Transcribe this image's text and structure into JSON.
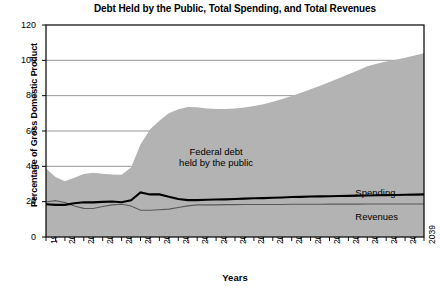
{
  "chart_data": {
    "type": "area",
    "title": "Debt Held by the Public, Total Spending, and Total Revenues",
    "xlabel": "Years",
    "ylabel": "Percentage of Gross Domestic Product",
    "xlim": [
      1999,
      2039
    ],
    "ylim": [
      0,
      120
    ],
    "yticks": [
      0,
      20,
      40,
      60,
      80,
      100,
      120
    ],
    "xticks": [
      1999,
      2001,
      2003,
      2005,
      2007,
      2009,
      2011,
      2013,
      2015,
      2017,
      2019,
      2021,
      2023,
      2025,
      2027,
      2029,
      2031,
      2033,
      2035,
      2037,
      2039
    ],
    "grid": "horizontal",
    "legend": "inline-annotations",
    "annotations": [
      {
        "name": "federal-debt-annotation",
        "line1": "Federal debt",
        "line2": "held by the public"
      },
      {
        "name": "spending-label",
        "text": "Spending"
      },
      {
        "name": "revenues-label",
        "text": "Revenues"
      }
    ],
    "colors": {
      "area_fill": "#b3b3b3",
      "spending_line": "#000000",
      "revenues_line": "#595959",
      "grid": "#8c8c8c",
      "axis": "#000000",
      "background": "#ffffff"
    },
    "x": [
      1999,
      2000,
      2001,
      2002,
      2003,
      2004,
      2005,
      2006,
      2007,
      2008,
      2009,
      2010,
      2011,
      2012,
      2013,
      2014,
      2015,
      2016,
      2017,
      2018,
      2019,
      2020,
      2021,
      2022,
      2023,
      2024,
      2025,
      2026,
      2027,
      2028,
      2029,
      2030,
      2031,
      2032,
      2033,
      2034,
      2035,
      2036,
      2037,
      2038,
      2039
    ],
    "series": [
      {
        "name": "Federal debt held by the public",
        "type": "area",
        "values": [
          38.8,
          34.0,
          31.5,
          33.6,
          35.6,
          36.3,
          35.8,
          35.4,
          35.2,
          39.3,
          52.3,
          60.9,
          65.8,
          70.1,
          72.3,
          73.6,
          73.4,
          72.8,
          72.5,
          72.4,
          72.7,
          73.3,
          74.1,
          75.2,
          76.5,
          78.1,
          79.8,
          81.7,
          83.6,
          85.6,
          87.7,
          89.9,
          92.1,
          94.3,
          96.6,
          98.0,
          99.3,
          100.4,
          101.5,
          102.8,
          104.0
        ]
      },
      {
        "name": "Spending",
        "type": "line",
        "values": [
          18.5,
          18.2,
          18.2,
          19.1,
          19.7,
          19.6,
          19.9,
          20.1,
          19.7,
          20.8,
          25.2,
          24.1,
          24.1,
          22.8,
          21.5,
          20.9,
          20.9,
          21.1,
          21.2,
          21.3,
          21.5,
          21.7,
          21.9,
          22.0,
          22.2,
          22.4,
          22.6,
          22.7,
          22.9,
          23.0,
          23.1,
          23.2,
          23.3,
          23.4,
          23.5,
          23.6,
          23.7,
          23.8,
          23.9,
          24.0,
          24.1
        ]
      },
      {
        "name": "Revenues",
        "type": "line",
        "values": [
          19.8,
          20.6,
          19.5,
          17.6,
          16.2,
          16.1,
          17.3,
          18.2,
          18.5,
          17.6,
          15.1,
          15.1,
          15.4,
          15.8,
          16.7,
          17.6,
          18.2,
          18.2,
          18.2,
          18.3,
          18.3,
          18.4,
          18.4,
          18.4,
          18.4,
          18.4,
          18.5,
          18.5,
          18.5,
          18.5,
          18.6,
          18.6,
          18.6,
          18.6,
          18.7,
          18.7,
          18.7,
          18.7,
          18.7,
          18.7,
          18.7
        ]
      }
    ]
  }
}
